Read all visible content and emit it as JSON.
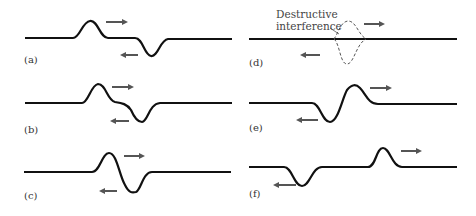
{
  "figure": {
    "colors": {
      "string": "#111111",
      "arrow": "#555555",
      "dashed": "#555555"
    },
    "panels": [
      {
        "id": "a",
        "label": "(a)"
      },
      {
        "id": "b",
        "label": "(b)"
      },
      {
        "id": "c",
        "label": "(c)"
      },
      {
        "id": "d",
        "label": "(d)",
        "annotation_line1": "Destructive",
        "annotation_line2": "interference"
      },
      {
        "id": "e",
        "label": "(e)"
      },
      {
        "id": "f",
        "label": "(f)"
      }
    ]
  }
}
